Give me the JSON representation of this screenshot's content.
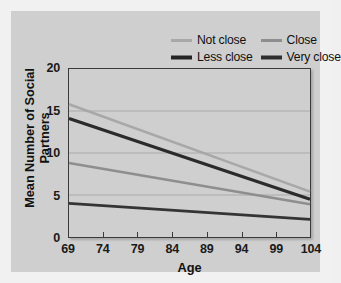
{
  "figure": {
    "background": "#f1f1f1",
    "panel_color": "#cfcfcf"
  },
  "chart_data": {
    "type": "line",
    "title": "",
    "xlabel": "Age",
    "ylabel": "Mean Number of Social Partners",
    "x": [
      69,
      104
    ],
    "xlim": [
      69,
      104
    ],
    "ylim": [
      0,
      20
    ],
    "xticks": [
      "69",
      "74",
      "79",
      "84",
      "89",
      "94",
      "99",
      "104"
    ],
    "yticks": [
      "0",
      "5",
      "10",
      "15",
      "20"
    ],
    "grid": "horizontal",
    "legend_position": "top-right",
    "series": [
      {
        "name": "Not close",
        "color": "#a8a8a8",
        "width": 2.6,
        "values": [
          15.8,
          5.4
        ]
      },
      {
        "name": "Close",
        "color": "#8e8e8e",
        "width": 2.6,
        "values": [
          8.8,
          3.9
        ]
      },
      {
        "name": "Less close",
        "color": "#2b2b2b",
        "width": 3.2,
        "values": [
          14.1,
          4.5
        ]
      },
      {
        "name": "Very close",
        "color": "#343434",
        "width": 2.8,
        "values": [
          4.0,
          2.1
        ]
      }
    ]
  },
  "legend": {
    "items": [
      {
        "label": "Not close",
        "color": "#a8a8a8",
        "width": 3
      },
      {
        "label": "Close",
        "color": "#8e8e8e",
        "width": 3
      },
      {
        "label": "Less close",
        "color": "#242424",
        "width": 4
      },
      {
        "label": "Very close",
        "color": "#2e2e2e",
        "width": 4
      }
    ]
  },
  "axes": {
    "frame_color": "#3a3a3a",
    "gridline_color": "#9a9a9a"
  }
}
